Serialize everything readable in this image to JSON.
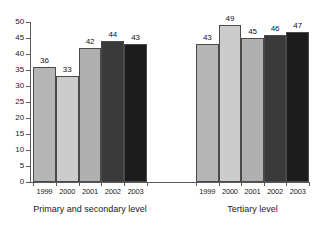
{
  "chart_data": {
    "type": "bar",
    "title": "",
    "xlabel": "",
    "ylabel": "",
    "ylim": [
      0,
      50
    ],
    "ytick_step": 5,
    "grid": false,
    "legend": "none",
    "yticks": [
      "50",
      "45",
      "40",
      "35",
      "30",
      "25",
      "20",
      "15",
      "10",
      "5",
      "0"
    ],
    "categories": [
      "1999",
      "2000",
      "2001",
      "2002",
      "2003"
    ],
    "groups": [
      {
        "name": "Primary and secondary level",
        "caption": "Primary and secondary level",
        "categories": [
          "1999",
          "2000",
          "2001",
          "2002",
          "2003"
        ],
        "values": [
          36,
          33,
          42,
          44,
          43
        ],
        "labels": [
          "36",
          "33",
          "42",
          "44",
          "43"
        ],
        "colors": [
          "#b5b5b5",
          "#cccccc",
          "#b0b0b0",
          "#3a3a3a",
          "#1c1c1c"
        ]
      },
      {
        "name": "Tertiary level",
        "caption": "Tertiary level",
        "categories": [
          "1999",
          "2000",
          "2001",
          "2002",
          "2003"
        ],
        "values": [
          43,
          49,
          45,
          46,
          47
        ],
        "labels": [
          "43",
          "49",
          "45",
          "46",
          "47"
        ],
        "colors": [
          "#b5b5b5",
          "#cccccc",
          "#b0b0b0",
          "#3a3a3a",
          "#1c1c1c"
        ]
      }
    ]
  },
  "axis": {
    "line_color": "#5a5a5a",
    "background": "#ffffff"
  }
}
